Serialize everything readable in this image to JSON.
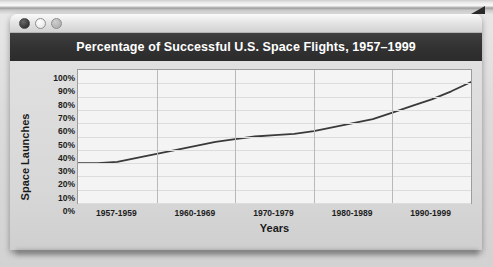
{
  "window": {
    "controls": [
      {
        "name": "close-button",
        "color": "#2b2b2b"
      },
      {
        "name": "minimize-button",
        "color": "#ededed"
      },
      {
        "name": "maximize-button",
        "color": "#b5b5b5"
      }
    ]
  },
  "chart_data": {
    "type": "line",
    "title": "Percentage of Successful U.S. Space Flights, 1957–1999",
    "xlabel": "Years",
    "ylabel": "Space Launches",
    "categories": [
      "1957-1959",
      "1960-1969",
      "1970-1979",
      "1980-1989",
      "1990-1999"
    ],
    "ytick_labels": [
      "100%",
      "90%",
      "80%",
      "70%",
      "60%",
      "50%",
      "40%",
      "30%",
      "20%",
      "10%",
      "0%"
    ],
    "ylim": [
      0,
      100
    ],
    "grid": true,
    "legend": null,
    "line_color": "#3a3a3a",
    "series": [
      {
        "name": "Percentage of successful launches",
        "x": [
          0,
          5,
          10,
          15,
          20,
          25,
          30,
          35,
          40,
          45,
          50,
          55,
          60,
          65,
          70,
          75,
          80,
          85,
          90,
          95,
          100
        ],
        "values": [
          30,
          30,
          31,
          34,
          37,
          40,
          43,
          46,
          48,
          50,
          51,
          52,
          54,
          57,
          60,
          63,
          68,
          73,
          78,
          84,
          91
        ]
      }
    ]
  }
}
